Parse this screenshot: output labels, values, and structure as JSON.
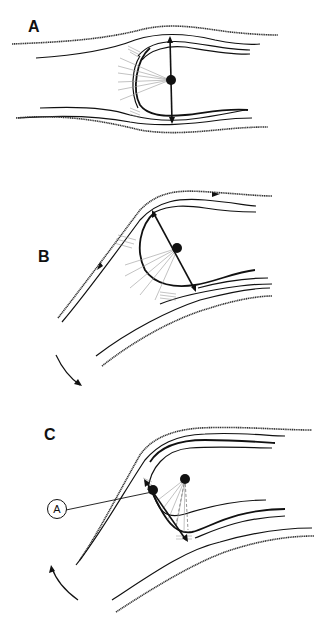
{
  "figure": {
    "panels": [
      {
        "id": "A",
        "label": "A",
        "description": "Straight channel with concave bow-shaped structure; symmetric double-headed axis through central point"
      },
      {
        "id": "B",
        "label": "B",
        "description": "Channel bending; structure rotated with tilted double-headed axis; flow arrows along outer streamline"
      },
      {
        "id": "C",
        "label": "C",
        "description": "Strongly bent channel; displaced central point with dashed projections; callout A marks pivot point"
      }
    ],
    "callout": {
      "label": "A"
    },
    "colors": {
      "ink": "#111111",
      "rays": "#999999",
      "background": "#ffffff"
    }
  }
}
